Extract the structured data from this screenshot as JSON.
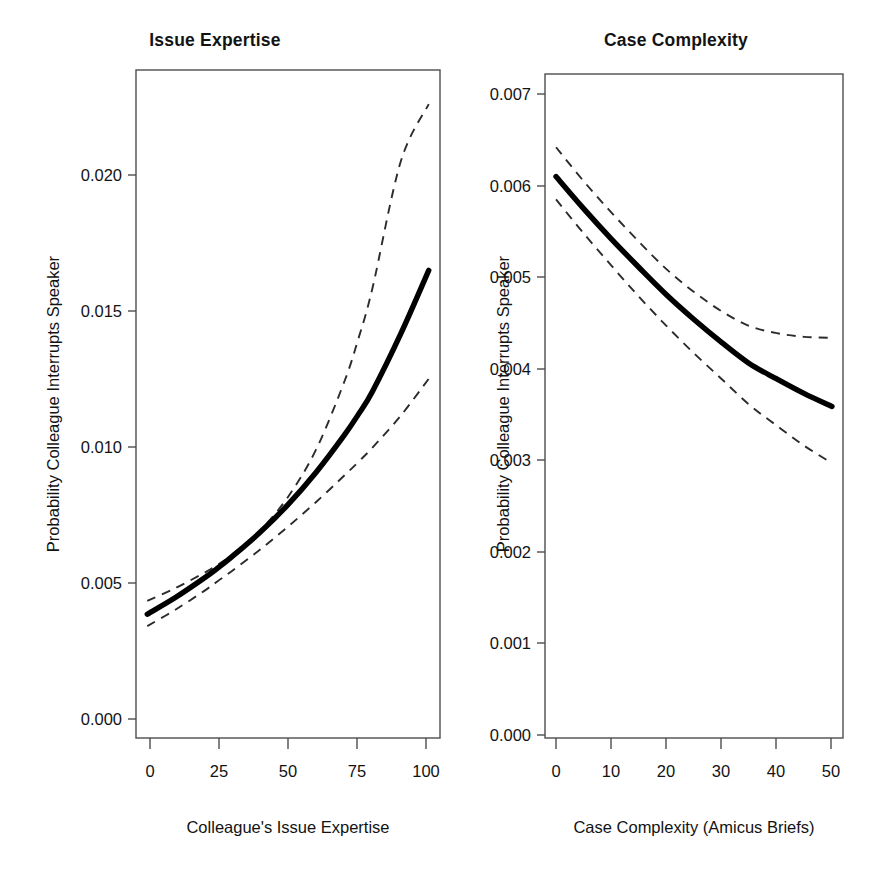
{
  "chart_data": [
    {
      "type": "line",
      "title": "Issue Expertise",
      "xlabel": "Colleague's Issue Expertise",
      "ylabel": "Probability Colleague Interrupts Speaker",
      "xlim": [
        -4,
        104
      ],
      "ylim": [
        0.0,
        0.0225
      ],
      "xticks": [
        0,
        25,
        50,
        75,
        100
      ],
      "xtick_labels": [
        "0",
        "25",
        "50",
        "75",
        "100"
      ],
      "yticks": [
        0.0,
        0.005,
        0.01,
        0.015,
        0.02
      ],
      "ytick_labels": [
        "0.000",
        "0.005",
        "0.010",
        "0.015",
        "0.020"
      ],
      "grid": false,
      "legend": "none",
      "x": [
        0,
        10,
        20,
        25,
        30,
        40,
        50,
        60,
        70,
        75,
        80,
        90,
        100
      ],
      "series": [
        {
          "name": "Predicted probability",
          "style": "solid",
          "values": [
            0.00417,
            0.00473,
            0.00537,
            0.00572,
            0.0061,
            0.00692,
            0.00786,
            0.00895,
            0.0102,
            0.0109,
            0.01167,
            0.0136,
            0.01575
          ]
        },
        {
          "name": "Upper 95% confidence bound",
          "style": "dashed",
          "values": [
            0.00462,
            0.00505,
            0.00555,
            0.00583,
            0.00616,
            0.00698,
            0.00812,
            0.00972,
            0.012,
            0.01345,
            0.01515,
            0.0194,
            0.02135
          ]
        },
        {
          "name": "Lower 95% confidence bound",
          "style": "dashed",
          "values": [
            0.00377,
            0.00432,
            0.00494,
            0.00528,
            0.00562,
            0.00634,
            0.00712,
            0.00795,
            0.00884,
            0.0093,
            0.00978,
            0.01085,
            0.0121
          ]
        }
      ]
    },
    {
      "type": "line",
      "title": "Case Complexity",
      "xlabel": "Case Complexity (Amicus Briefs)",
      "ylabel": "Probability Colleague Interrupts Speaker",
      "xlim": [
        -2,
        52
      ],
      "ylim": [
        0.0,
        0.00725
      ],
      "xticks": [
        0,
        10,
        20,
        30,
        40,
        50
      ],
      "xtick_labels": [
        "0",
        "10",
        "20",
        "30",
        "40",
        "50"
      ],
      "yticks": [
        0.0,
        0.001,
        0.002,
        0.003,
        0.004,
        0.005,
        0.006,
        0.007
      ],
      "ytick_labels": [
        "0.000",
        "0.001",
        "0.002",
        "0.003",
        "0.004",
        "0.005",
        "0.006",
        "0.007"
      ],
      "grid": false,
      "legend": "none",
      "x": [
        0,
        5,
        10,
        15,
        20,
        25,
        30,
        35,
        40,
        45,
        50
      ],
      "series": [
        {
          "name": "Predicted probability",
          "style": "solid",
          "values": [
            0.00613,
            0.00578,
            0.00545,
            0.00514,
            0.00484,
            0.00457,
            0.00432,
            0.00409,
            0.00392,
            0.00376,
            0.00362
          ]
        },
        {
          "name": "Upper 95% confidence bound",
          "style": "dashed",
          "values": [
            0.00645,
            0.00608,
            0.00574,
            0.00542,
            0.00512,
            0.00487,
            0.00466,
            0.0045,
            0.00442,
            0.00438,
            0.00437
          ]
        },
        {
          "name": "Lower 95% confidence bound",
          "style": "dashed",
          "values": [
            0.00588,
            0.00551,
            0.00516,
            0.00482,
            0.0045,
            0.0042,
            0.00392,
            0.00364,
            0.00341,
            0.00319,
            0.003
          ]
        }
      ]
    }
  ],
  "panels": {
    "left": {
      "title": "Issue Expertise",
      "xlabel": "Colleague's Issue Expertise",
      "ylabel": "Probability Colleague Interrupts Speaker",
      "ytick_labels": [
        "0.020",
        "0.015",
        "0.010",
        "0.005",
        "0.000"
      ],
      "xtick_labels": [
        "0",
        "25",
        "50",
        "75",
        "100"
      ]
    },
    "right": {
      "title": "Case Complexity",
      "xlabel": "Case Complexity (Amicus Briefs)",
      "ylabel": "Probability Colleague Interrupts Speaker",
      "ytick_labels": [
        "0.007",
        "0.006",
        "0.005",
        "0.004",
        "0.003",
        "0.002",
        "0.001",
        "0.000"
      ],
      "xtick_labels": [
        "0",
        "10",
        "20",
        "30",
        "40",
        "50"
      ]
    }
  }
}
